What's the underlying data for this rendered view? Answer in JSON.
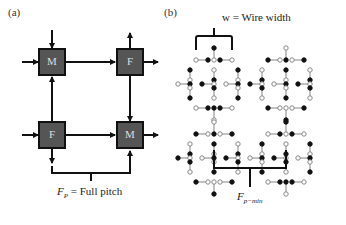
{
  "panel_a": {
    "label": "(a)",
    "boxes": [
      {
        "id": "top-left",
        "text": "M"
      },
      {
        "id": "top-right",
        "text": "F"
      },
      {
        "id": "bottom-left",
        "text": "F"
      },
      {
        "id": "bottom-right",
        "text": "M"
      }
    ],
    "caption": {
      "symbol": "F",
      "subscript": "P",
      "text": " = Full pitch"
    },
    "box_fill": "#555555",
    "line_color": "#111111"
  },
  "panel_b": {
    "label": "(b)",
    "top_caption": "w = Wire width",
    "bottom_caption": {
      "symbol": "F",
      "subscript": "p−min"
    },
    "node_filled_color": "#111111",
    "node_open_color": "#ffffff",
    "link_color": "#999999"
  }
}
